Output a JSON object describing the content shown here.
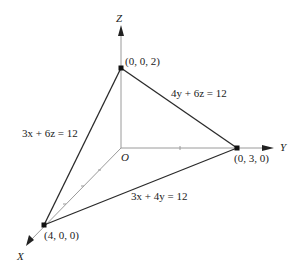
{
  "diagram": {
    "type": "3d-plane-intercepts",
    "axes": {
      "x_label": "X",
      "y_label": "Y",
      "z_label": "Z",
      "origin_label": "O"
    },
    "points": {
      "x_intercept": "(4, 0, 0)",
      "y_intercept": "(0, 3, 0)",
      "z_intercept": "(0, 0, 2)"
    },
    "traces": {
      "xz": "3x + 6z = 12",
      "yz": "4y + 6z = 12",
      "xy": "3x + 4y = 12"
    },
    "colors": {
      "line": "#2a2a2a",
      "axis": "#9a9a9a",
      "text": "#222222"
    }
  }
}
